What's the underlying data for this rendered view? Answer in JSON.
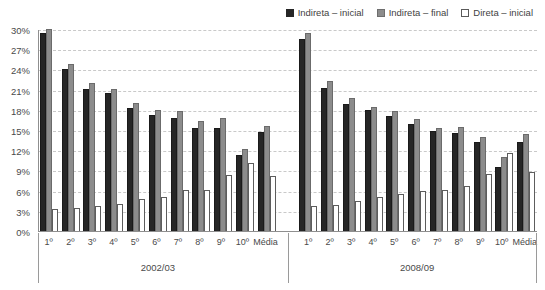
{
  "legend": {
    "position": "top-right",
    "items": [
      {
        "label": "Indireta – inicial",
        "swatch": "dark-square-icon",
        "color": "#262626"
      },
      {
        "label": "Indireta – final",
        "swatch": "gray-square-icon",
        "color": "#8c8c8c"
      },
      {
        "label": "Direta – inicial",
        "swatch": "white-square-icon",
        "color": "#ffffff"
      }
    ]
  },
  "axis": {
    "y_ticks": [
      "0%",
      "3%",
      "6%",
      "9%",
      "12%",
      "15%",
      "18%",
      "21%",
      "24%",
      "27%",
      "30%"
    ],
    "y_min": 0,
    "y_max": 30,
    "y_step": 3
  },
  "chart_data": {
    "type": "bar",
    "title": "",
    "xlabel": "",
    "ylabel": "",
    "ylim": [
      0,
      30
    ],
    "grid": true,
    "legend_position": "top-right",
    "categories": [
      "1º",
      "2º",
      "3º",
      "4º",
      "5º",
      "6º",
      "7º",
      "8º",
      "9º",
      "10º",
      "Média"
    ],
    "groups": [
      {
        "name": "2002/03",
        "series": [
          {
            "name": "Indireta – inicial",
            "values": [
              29.5,
              24.2,
              21.3,
              20.6,
              18.4,
              17.4,
              17.0,
              15.5,
              15.5,
              11.4,
              14.8
            ]
          },
          {
            "name": "Indireta – final",
            "values": [
              30.2,
              25.0,
              22.2,
              21.2,
              19.1,
              18.1,
              18.0,
              16.5,
              17.0,
              12.4,
              15.8
            ]
          },
          {
            "name": "Direta – inicial",
            "values": [
              3.4,
              3.5,
              3.8,
              4.2,
              4.9,
              5.2,
              6.3,
              6.3,
              8.5,
              10.2,
              8.3
            ]
          }
        ]
      },
      {
        "name": "2008/09",
        "series": [
          {
            "name": "Indireta – inicial",
            "values": [
              28.6,
              21.4,
              19.0,
              18.1,
              17.2,
              16.0,
              15.0,
              14.7,
              13.4,
              9.7,
              13.3
            ]
          },
          {
            "name": "Indireta – final",
            "values": [
              29.5,
              22.4,
              19.9,
              18.6,
              17.9,
              16.8,
              15.4,
              15.6,
              14.1,
              11.1,
              14.6
            ]
          },
          {
            "name": "Direta – inicial",
            "values": [
              3.9,
              4.0,
              4.6,
              5.2,
              5.6,
              6.1,
              6.2,
              6.9,
              8.6,
              11.8,
              8.9
            ]
          }
        ]
      }
    ]
  }
}
